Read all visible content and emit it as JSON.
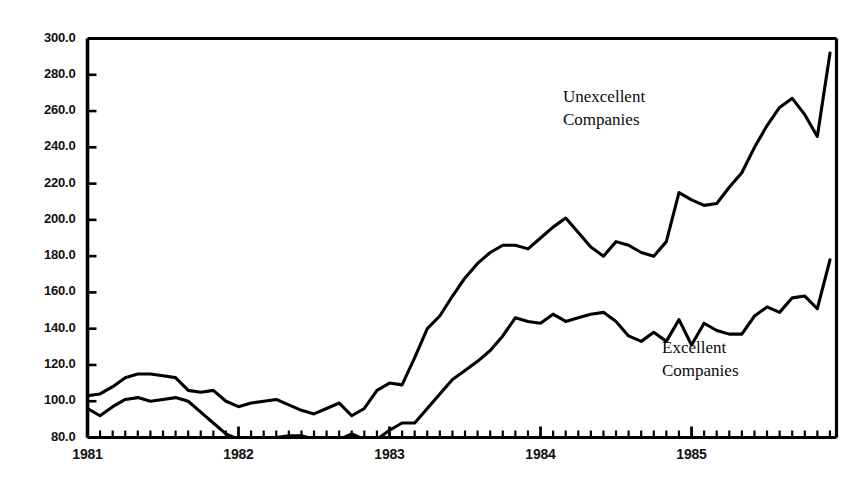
{
  "chart_data": {
    "type": "line",
    "title": "",
    "subtitle": "",
    "xlabel": "",
    "ylabel": "",
    "xlim": [
      1981.0,
      1985.96
    ],
    "ylim": [
      80.0,
      300.0
    ],
    "grid": false,
    "legend_position": "inline-annotation",
    "y_ticks": [
      80.0,
      100.0,
      120.0,
      140.0,
      160.0,
      180.0,
      200.0,
      220.0,
      240.0,
      260.0,
      280.0,
      300.0
    ],
    "y_tick_labels": [
      "80.0",
      "100.0",
      "120.0",
      "140.0",
      "160.0",
      "180.0",
      "200.0",
      "220.0",
      "240.0",
      "260.0",
      "280.0",
      "300.0"
    ],
    "x_ticks": [
      1981,
      1982,
      1983,
      1984,
      1985
    ],
    "x_tick_labels": [
      "1981",
      "1982",
      "1983",
      "1984",
      "1985"
    ],
    "x_minor_tick_interval_months": 1,
    "note": "Monthly index values, Jan 1981 through Dec 1985. Excellent Companies series falls below the 80.0 axis floor during 1982 and is clipped at the axis.",
    "series": [
      {
        "name": "Unexcellent Companies",
        "label_lines": [
          "Unexcellent",
          "Companies"
        ],
        "color": "#000000",
        "x": [
          1981.0,
          1981.083,
          1981.167,
          1981.25,
          1981.333,
          1981.417,
          1981.5,
          1981.583,
          1981.667,
          1981.75,
          1981.833,
          1981.917,
          1982.0,
          1982.083,
          1982.167,
          1982.25,
          1982.333,
          1982.417,
          1982.5,
          1982.583,
          1982.667,
          1982.75,
          1982.833,
          1982.917,
          1983.0,
          1983.083,
          1983.167,
          1983.25,
          1983.333,
          1983.417,
          1983.5,
          1983.583,
          1983.667,
          1983.75,
          1983.833,
          1983.917,
          1984.0,
          1984.083,
          1984.167,
          1984.25,
          1984.333,
          1984.417,
          1984.5,
          1984.583,
          1984.667,
          1984.75,
          1984.833,
          1984.917,
          1985.0,
          1985.083,
          1985.167,
          1985.25,
          1985.333,
          1985.417,
          1985.5,
          1985.583,
          1985.667,
          1985.75,
          1985.833,
          1985.917
        ],
        "values": [
          103,
          104,
          108,
          113,
          115,
          115,
          114,
          113,
          106,
          105,
          106,
          100,
          97,
          99,
          100,
          101,
          98,
          95,
          93,
          96,
          99,
          92,
          96,
          106,
          110,
          109,
          124,
          140,
          147,
          158,
          168,
          176,
          182,
          186,
          186,
          184,
          190,
          196,
          201,
          193,
          185,
          180,
          188,
          186,
          182,
          180,
          188,
          215,
          211,
          208,
          209,
          218,
          226,
          240,
          252,
          262,
          267,
          258,
          246,
          292
        ]
      },
      {
        "name": "Excellent Companies",
        "label_lines": [
          "Excellent",
          "Companies"
        ],
        "color": "#000000",
        "x": [
          1981.0,
          1981.083,
          1981.167,
          1981.25,
          1981.333,
          1981.417,
          1981.5,
          1981.583,
          1981.667,
          1981.75,
          1981.833,
          1981.917,
          1982.0,
          1982.083,
          1982.167,
          1982.25,
          1982.333,
          1982.417,
          1982.5,
          1982.583,
          1982.667,
          1982.75,
          1982.833,
          1982.917,
          1983.0,
          1983.083,
          1983.167,
          1983.25,
          1983.333,
          1983.417,
          1983.5,
          1983.583,
          1983.667,
          1983.75,
          1983.833,
          1983.917,
          1984.0,
          1984.083,
          1984.167,
          1984.25,
          1984.333,
          1984.417,
          1984.5,
          1984.583,
          1984.667,
          1984.75,
          1984.833,
          1984.917,
          1985.0,
          1985.083,
          1985.167,
          1985.25,
          1985.333,
          1985.417,
          1985.5,
          1985.583,
          1985.667,
          1985.75,
          1985.833,
          1985.917
        ],
        "values": [
          96,
          92,
          97,
          101,
          102,
          100,
          101,
          102,
          100,
          94,
          88,
          82,
          79,
          78,
          78,
          80,
          81,
          81,
          79,
          78,
          79,
          82,
          79,
          79,
          84,
          88,
          88,
          96,
          104,
          112,
          117,
          122,
          128,
          136,
          146,
          144,
          143,
          148,
          144,
          146,
          148,
          149,
          144,
          136,
          133,
          138,
          133,
          145,
          131,
          143,
          139,
          137,
          137,
          147,
          152,
          149,
          157,
          158,
          151,
          178
        ]
      }
    ]
  },
  "axes": {
    "frame_color": "#000000",
    "line_color": "#000000"
  }
}
